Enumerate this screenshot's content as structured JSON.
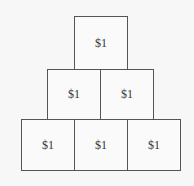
{
  "diagram": {
    "type": "coin-pyramid",
    "rows": [
      {
        "cells": [
          {
            "label": "$1"
          }
        ]
      },
      {
        "cells": [
          {
            "label": "$1"
          },
          {
            "label": "$1"
          }
        ]
      },
      {
        "cells": [
          {
            "label": "$1"
          },
          {
            "label": "$1"
          },
          {
            "label": "$1"
          }
        ]
      }
    ]
  }
}
